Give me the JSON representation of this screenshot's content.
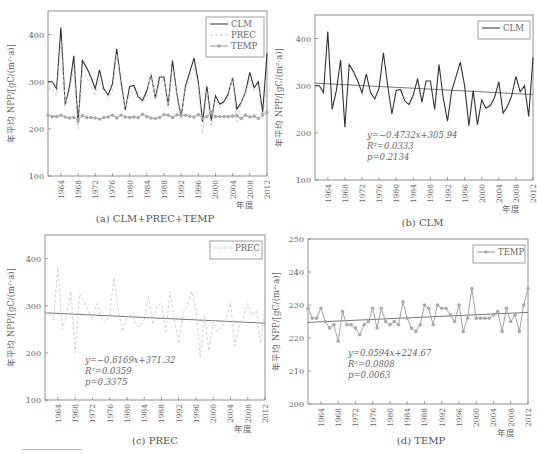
{
  "figure": {
    "panels": [
      {
        "id": "a",
        "caption": "(a) CLM+PREC+TEMP"
      },
      {
        "id": "b",
        "caption": "(b) CLM"
      },
      {
        "id": "c",
        "caption": "(c) PREC"
      },
      {
        "id": "d",
        "caption": "(d) TEMP"
      }
    ]
  },
  "chart_data": [
    {
      "type": "line",
      "title": "(a) CLM+PREC+TEMP",
      "xlabel": "年度",
      "ylabel": "年平均 NPP/[gC/(m²·a)]",
      "ylim": [
        100,
        450
      ],
      "yticks": [
        100,
        200,
        300,
        400
      ],
      "xticks": [
        "1964",
        "1968",
        "1972",
        "1976",
        "1980",
        "1984",
        "1988",
        "1992",
        "1996",
        "2000",
        "2004",
        "2008",
        "2012"
      ],
      "legend": [
        "CLM",
        "PREC",
        "TEMP"
      ],
      "legend_position": "upper right",
      "grid": false,
      "x": [
        1961,
        1962,
        1963,
        1964,
        1965,
        1966,
        1967,
        1968,
        1969,
        1970,
        1971,
        1972,
        1973,
        1974,
        1975,
        1976,
        1977,
        1978,
        1979,
        1980,
        1981,
        1982,
        1983,
        1984,
        1985,
        1986,
        1987,
        1988,
        1989,
        1990,
        1991,
        1992,
        1993,
        1994,
        1995,
        1996,
        1997,
        1998,
        1999,
        2000,
        2001,
        2002,
        2003,
        2004,
        2005,
        2006,
        2007,
        2008,
        2009,
        2010,
        2011,
        2012
      ],
      "series": [
        {
          "name": "CLM",
          "color": "#333333",
          "values": [
            300,
            300,
            285,
            415,
            250,
            290,
            355,
            212,
            345,
            330,
            310,
            285,
            325,
            285,
            272,
            295,
            370,
            300,
            240,
            290,
            292,
            268,
            260,
            280,
            315,
            265,
            310,
            310,
            250,
            345,
            275,
            225,
            290,
            320,
            350,
            300,
            215,
            290,
            217,
            270,
            252,
            258,
            275,
            308,
            242,
            256,
            278,
            320,
            287,
            300,
            235,
            360
          ]
        },
        {
          "name": "PREC",
          "color": "#cccccc",
          "dash": "3,2",
          "values": [
            285,
            285,
            270,
            385,
            250,
            280,
            330,
            200,
            325,
            310,
            290,
            270,
            305,
            275,
            265,
            280,
            360,
            290,
            245,
            275,
            280,
            265,
            255,
            270,
            320,
            260,
            300,
            305,
            245,
            330,
            270,
            220,
            285,
            300,
            330,
            290,
            190,
            280,
            205,
            265,
            245,
            255,
            270,
            310,
            215,
            255,
            275,
            305,
            280,
            290,
            220,
            300
          ]
        },
        {
          "name": "TEMP",
          "color": "#999999",
          "marker": "circle",
          "values": [
            229,
            226,
            226,
            229,
            225,
            223,
            224,
            219,
            228,
            224,
            224,
            223,
            221,
            224,
            225,
            229,
            223,
            229,
            225,
            224,
            225,
            224,
            231,
            226,
            223,
            222,
            224,
            230,
            229,
            224,
            230,
            229,
            229,
            227,
            225,
            230,
            222,
            226,
            235,
            226,
            226,
            226,
            226,
            227,
            228,
            222,
            229,
            225,
            227,
            222,
            230,
            235
          ]
        }
      ]
    },
    {
      "type": "line",
      "title": "(b) CLM",
      "xlabel": "年度",
      "ylabel": "年平均 NPP/[gC/(m²·a)]",
      "ylim": [
        100,
        450
      ],
      "yticks": [
        100,
        200,
        300,
        400
      ],
      "xticks": [
        "1964",
        "1968",
        "1972",
        "1976",
        "1980",
        "1984",
        "1988",
        "1992",
        "1996",
        "2000",
        "2004",
        "2008",
        "2012"
      ],
      "legend": [
        "CLM"
      ],
      "legend_position": "upper right",
      "annotations": [
        "y=−0.4732x+305.94",
        "R²=0.0333",
        "p=0.2134"
      ],
      "trend": {
        "slope": -0.4732,
        "intercept": 305.94
      },
      "series": [
        {
          "name": "CLM",
          "color": "#333333",
          "values": [
            300,
            300,
            285,
            415,
            250,
            290,
            355,
            212,
            345,
            330,
            310,
            285,
            325,
            285,
            272,
            295,
            370,
            300,
            240,
            290,
            292,
            268,
            260,
            280,
            315,
            265,
            310,
            310,
            250,
            345,
            275,
            225,
            290,
            320,
            350,
            300,
            215,
            290,
            217,
            270,
            252,
            258,
            275,
            308,
            242,
            256,
            278,
            320,
            287,
            300,
            235,
            360
          ]
        }
      ]
    },
    {
      "type": "line",
      "title": "(c) PREC",
      "xlabel": "年度",
      "ylabel": "年平均 NPP/[gC/(m²·a)]",
      "ylim": [
        100,
        450
      ],
      "yticks": [
        100,
        200,
        300,
        400
      ],
      "xticks": [
        "1964",
        "1968",
        "1972",
        "1976",
        "1980",
        "1984",
        "1988",
        "1992",
        "1996",
        "2000",
        "2004",
        "2008",
        "2012"
      ],
      "legend": [
        "PREC"
      ],
      "legend_position": "upper right",
      "annotations": [
        "y=−0.6169x+371.32",
        "R²=0.0359",
        "p=0.3375"
      ],
      "trend": {
        "slope": -0.6169,
        "intercept": 371.32,
        "display_start": 285,
        "display_end": 263
      },
      "series": [
        {
          "name": "PREC",
          "color": "#cccccc",
          "dash": "3,2",
          "values": [
            285,
            285,
            270,
            385,
            250,
            280,
            330,
            200,
            325,
            310,
            290,
            270,
            305,
            275,
            265,
            280,
            360,
            290,
            245,
            275,
            280,
            265,
            255,
            270,
            320,
            260,
            300,
            305,
            245,
            330,
            270,
            220,
            285,
            300,
            330,
            290,
            190,
            280,
            205,
            265,
            245,
            255,
            270,
            310,
            215,
            255,
            275,
            305,
            280,
            290,
            220,
            300
          ]
        }
      ]
    },
    {
      "type": "line",
      "title": "(d) TEMP",
      "xlabel": "年度",
      "ylabel": "年平均 NPP/[gC/(m²·a)]",
      "ylim": [
        200,
        250
      ],
      "yticks": [
        200,
        210,
        220,
        230,
        240,
        250
      ],
      "xticks": [
        "1964",
        "1968",
        "1972",
        "1976",
        "1980",
        "1984",
        "1988",
        "1992",
        "1996",
        "2000",
        "2004",
        "2008",
        "2012"
      ],
      "legend": [
        "TEMP"
      ],
      "legend_position": "upper right",
      "annotations": [
        "y=0.0594x+224.67",
        "R²=0.0808",
        "p=0.0063"
      ],
      "trend": {
        "slope": 0.0594,
        "intercept": 224.67
      },
      "series": [
        {
          "name": "TEMP",
          "color": "#999999",
          "marker": "circle",
          "values": [
            229,
            226,
            226,
            229,
            225,
            223,
            224,
            219,
            228,
            224,
            224,
            223,
            221,
            224,
            225,
            229,
            223,
            229,
            225,
            224,
            225,
            224,
            231,
            226,
            223,
            222,
            224,
            230,
            229,
            224,
            230,
            229,
            229,
            227,
            225,
            230,
            222,
            226,
            235,
            226,
            226,
            226,
            226,
            227,
            228,
            222,
            229,
            225,
            227,
            222,
            230,
            235
          ]
        }
      ]
    }
  ]
}
